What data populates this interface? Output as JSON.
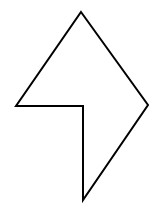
{
  "diagram": {
    "type": "polygon",
    "background": "#ffffff",
    "stroke": "#000000",
    "stroke_width": 2,
    "fill": "#ffffff",
    "vertices": [
      {
        "name": "top",
        "x": 81,
        "y": 12
      },
      {
        "name": "right",
        "x": 148,
        "y": 105
      },
      {
        "name": "bottom",
        "x": 83,
        "y": 200
      },
      {
        "name": "inner-corner",
        "x": 83,
        "y": 106
      },
      {
        "name": "left",
        "x": 16,
        "y": 106
      }
    ],
    "points": "81,12 148,105 83,200 83,106 16,106"
  }
}
